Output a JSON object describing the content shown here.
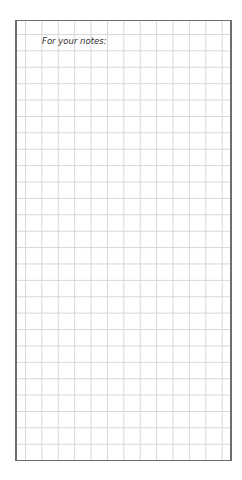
{
  "notes": {
    "heading": "For your notes:"
  }
}
